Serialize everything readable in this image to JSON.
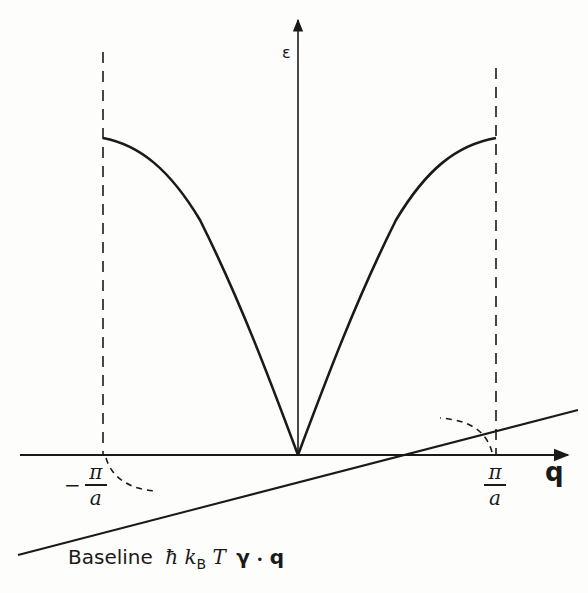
{
  "diagram": {
    "type": "phonon dispersion relation",
    "axes": {
      "y_label": "ε",
      "x_label": "q"
    },
    "zone_boundaries": {
      "left": {
        "sign": "−",
        "numerator": "π",
        "denominator": "a"
      },
      "right": {
        "numerator": "π",
        "denominator": "a"
      }
    },
    "baseline": {
      "prefix": "Baseline",
      "hbar": "ħ",
      "k": "k",
      "k_sub": "B",
      "T": "T",
      "gamma": "γ",
      "dot": "•",
      "q": "q"
    },
    "colors": {
      "ink": "#1a1a1a",
      "paper": "#fdfdfb"
    }
  }
}
